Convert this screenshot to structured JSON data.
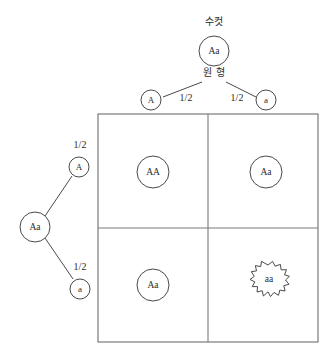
{
  "diagram": {
    "type": "punnett-square-genetic-cross",
    "title_label": "수컷",
    "phenotype_label": "원 형",
    "male_parent": {
      "genotype": "Aa",
      "gametes": [
        {
          "allele": "A",
          "probability": "1/2"
        },
        {
          "allele": "a",
          "probability": "1/2"
        }
      ]
    },
    "female_parent": {
      "genotype": "Aa",
      "gametes": [
        {
          "allele": "A",
          "probability": "1/2"
        },
        {
          "allele": "a",
          "probability": "1/2"
        }
      ]
    },
    "offspring_grid": [
      [
        {
          "genotype": "AA",
          "shape": "round"
        },
        {
          "genotype": "Aa",
          "shape": "round"
        }
      ],
      [
        {
          "genotype": "Aa",
          "shape": "round"
        },
        {
          "genotype": "aa",
          "shape": "wrinkled"
        }
      ]
    ],
    "colors": {
      "stroke": "#4a4a4a",
      "grid_stroke": "#7a7a7a",
      "text": "#2b2b2b",
      "background": "#ffffff"
    }
  }
}
